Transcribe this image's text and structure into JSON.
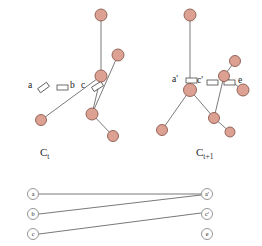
{
  "figure": {
    "background": "#ffffff",
    "node_fill": "#dda193",
    "node_stroke": "#8a5a4e",
    "edge_color": "#6b6b6b",
    "connector_fill": "#ffffff",
    "connector_stroke": "#4a4a4a",
    "small_node_stroke": "#7a7a7a",
    "text_color": "#1a1a1a"
  },
  "panels": [
    {
      "id": "left",
      "caption": "C",
      "caption_sub": "t",
      "caption_full": "C_t",
      "caption_x": 40,
      "caption_y": 146,
      "nodes": [
        {
          "name": "top-node",
          "x": 101,
          "y": 15,
          "r": 6.0
        },
        {
          "name": "center-node",
          "x": 101,
          "y": 76,
          "r": 6.0
        },
        {
          "name": "lower-left-node",
          "x": 41,
          "y": 120,
          "r": 5.5
        },
        {
          "name": "lower-mid-node",
          "x": 92,
          "y": 114,
          "r": 6.0
        },
        {
          "name": "bottom-node",
          "x": 113,
          "y": 136,
          "r": 5.5
        },
        {
          "name": "upper-right-node",
          "x": 118,
          "y": 55,
          "r": 6.0
        }
      ],
      "edges": [
        {
          "name": "edge-top-center",
          "x1": 101,
          "y1": 15,
          "x2": 101,
          "y2": 76
        },
        {
          "name": "edge-center-lowerleft",
          "x1": 101,
          "y1": 76,
          "x2": 41,
          "y2": 120
        },
        {
          "name": "edge-center-lowermid",
          "x1": 101,
          "y1": 76,
          "x2": 92,
          "y2": 114
        },
        {
          "name": "edge-lowermid-bottom",
          "x1": 92,
          "y1": 114,
          "x2": 113,
          "y2": 136
        },
        {
          "name": "edge-lowermid-upright",
          "x1": 92,
          "y1": 114,
          "x2": 118,
          "y2": 55
        }
      ],
      "connectors": [
        {
          "name": "connector-a",
          "x": 38,
          "y": 85,
          "w": 11,
          "h": 5,
          "angle": -36
        },
        {
          "name": "connector-b",
          "x": 57,
          "y": 85,
          "w": 11,
          "h": 5,
          "angle": 0
        },
        {
          "name": "connector-c",
          "x": 92,
          "y": 84,
          "w": 11,
          "h": 5,
          "angle": -32
        }
      ],
      "labels": [
        {
          "name": "label-a",
          "text": "a",
          "x": 28,
          "y": 80
        },
        {
          "name": "label-b",
          "text": "b",
          "x": 70,
          "y": 80
        },
        {
          "name": "label-c",
          "text": "c",
          "x": 81,
          "y": 80
        }
      ]
    },
    {
      "id": "right",
      "caption": "C",
      "caption_sub": "t+1",
      "caption_full": "C_t+1",
      "caption_x": 196,
      "caption_y": 146,
      "nodes": [
        {
          "name": "top-node",
          "x": 190,
          "y": 15,
          "r": 6.0
        },
        {
          "name": "center-node",
          "x": 190,
          "y": 90,
          "r": 6.5
        },
        {
          "name": "lower-left-node",
          "x": 162,
          "y": 130,
          "r": 5.5
        },
        {
          "name": "lower-mid-node",
          "x": 214,
          "y": 118,
          "r": 5.5
        },
        {
          "name": "bottom-right-node",
          "x": 230,
          "y": 132,
          "r": 5.0
        },
        {
          "name": "branch-node",
          "x": 224,
          "y": 76,
          "r": 5.5
        },
        {
          "name": "top-right-node",
          "x": 235,
          "y": 61,
          "r": 5.5
        },
        {
          "name": "far-right-node",
          "x": 243,
          "y": 90,
          "r": 6.0
        }
      ],
      "edges": [
        {
          "name": "edge-top-center",
          "x1": 190,
          "y1": 15,
          "x2": 190,
          "y2": 90
        },
        {
          "name": "edge-center-lowerleft",
          "x1": 190,
          "y1": 90,
          "x2": 162,
          "y2": 130
        },
        {
          "name": "edge-center-lowermid",
          "x1": 190,
          "y1": 90,
          "x2": 214,
          "y2": 118
        },
        {
          "name": "edge-lowermid-bottomrt",
          "x1": 214,
          "y1": 118,
          "x2": 230,
          "y2": 132
        },
        {
          "name": "edge-lowermid-branch",
          "x1": 214,
          "y1": 118,
          "x2": 224,
          "y2": 76
        },
        {
          "name": "edge-branch-topright",
          "x1": 224,
          "y1": 76,
          "x2": 235,
          "y2": 61
        },
        {
          "name": "edge-branch-farright",
          "x1": 224,
          "y1": 76,
          "x2": 243,
          "y2": 90
        }
      ],
      "connectors": [
        {
          "name": "connector-a-prime",
          "x": 186,
          "y": 78,
          "w": 11,
          "h": 5,
          "angle": 0
        },
        {
          "name": "connector-c-prime",
          "x": 207,
          "y": 80,
          "w": 11,
          "h": 5,
          "angle": 0
        },
        {
          "name": "connector-e",
          "x": 224,
          "y": 80,
          "w": 11,
          "h": 5,
          "angle": 0
        }
      ],
      "labels": [
        {
          "name": "label-a-prime",
          "text": "a'",
          "x": 172,
          "y": 74
        },
        {
          "name": "label-c-prime",
          "text": "c'",
          "x": 197,
          "y": 75
        },
        {
          "name": "label-e",
          "text": "e",
          "x": 238,
          "y": 75
        }
      ]
    }
  ],
  "bipartite": {
    "name": "bipartite-matching-graph",
    "node_radius": 5.5,
    "left_nodes": [
      {
        "name": "bip-left-a",
        "label": "a",
        "x": 33,
        "y": 194
      },
      {
        "name": "bip-left-b",
        "label": "b",
        "x": 33,
        "y": 214
      },
      {
        "name": "bip-left-c",
        "label": "c",
        "x": 33,
        "y": 234
      }
    ],
    "right_nodes": [
      {
        "name": "bip-right-a-prime",
        "label": "a'",
        "x": 207,
        "y": 194
      },
      {
        "name": "bip-right-c-prime",
        "label": "c'",
        "x": 207,
        "y": 214
      },
      {
        "name": "bip-right-e",
        "label": "e",
        "x": 207,
        "y": 234
      }
    ],
    "edges": [
      {
        "name": "bip-edge-a-aprime",
        "from": "a",
        "to": "a'",
        "x1": 39,
        "y1": 194,
        "x2": 201,
        "y2": 194
      },
      {
        "name": "bip-edge-b-aprime",
        "from": "b",
        "to": "a'",
        "x1": 39,
        "y1": 214,
        "x2": 201,
        "y2": 195
      },
      {
        "name": "bip-edge-c-cprime",
        "from": "c",
        "to": "c'",
        "x1": 39,
        "y1": 234,
        "x2": 201,
        "y2": 213
      }
    ]
  }
}
